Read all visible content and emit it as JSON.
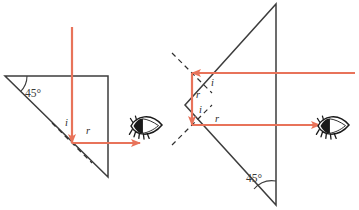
{
  "figure": {
    "background_color": "#ffffff",
    "ray_color": "#e8735a",
    "outline_color": "#3d3d3d",
    "dashed_color": "#2f2f2f",
    "eye_color": "#1a1a1a"
  },
  "diagrams": [
    {
      "id": "left-prism",
      "name": "single-reflection-prism",
      "angle_label": "45°",
      "ray_labels": {
        "incidence": "i",
        "reflection": "r"
      },
      "eye_icon": "eye-icon",
      "rays": [
        {
          "name": "incoming-vertical-ray",
          "direction": "down"
        },
        {
          "name": "outgoing-horizontal-ray",
          "direction": "right"
        }
      ],
      "geometry": {
        "apex": [
          5,
          76
        ],
        "top_right": [
          108,
          76
        ],
        "bottom_right": [
          108,
          177
        ],
        "reflection_point": [
          72,
          143
        ],
        "ray_entry_top": [
          72,
          30
        ],
        "ray_exit_right": [
          140,
          143
        ],
        "eye_position": [
          145,
          127
        ],
        "normal_start": [
          52,
          123
        ],
        "normal_end": [
          92,
          163
        ],
        "angle_arc_center": [
          5,
          76
        ],
        "angle_label_pos": [
          26,
          94
        ]
      }
    },
    {
      "id": "right-prism",
      "name": "double-reflection-prism",
      "angle_label": "45°",
      "ray_labels": {
        "incidence": "i",
        "reflection": "r"
      },
      "eye_icon": "eye-icon",
      "rays": [
        {
          "name": "incoming-horizontal-ray",
          "direction": "left"
        },
        {
          "name": "internal-vertical-ray",
          "direction": "down"
        },
        {
          "name": "outgoing-horizontal-ray",
          "direction": "right"
        }
      ],
      "geometry": {
        "apex": [
          185,
          105
        ],
        "top_right": [
          276,
          4
        ],
        "bottom_right": [
          276,
          205
        ],
        "upper_reflection_point": [
          192,
          73
        ],
        "lower_reflection_point": [
          192,
          125
        ],
        "ray_entry_right": [
          355,
          73
        ],
        "ray_exit_right": [
          318,
          125
        ],
        "eye_position": [
          330,
          127
        ],
        "upper_normal_start": [
          172,
          53
        ],
        "upper_normal_end": [
          212,
          93
        ],
        "lower_normal_start": [
          172,
          145
        ],
        "lower_normal_end": [
          212,
          105
        ],
        "angle_arc_center": [
          276,
          205
        ],
        "angle_label_pos": [
          252,
          180
        ]
      }
    }
  ]
}
